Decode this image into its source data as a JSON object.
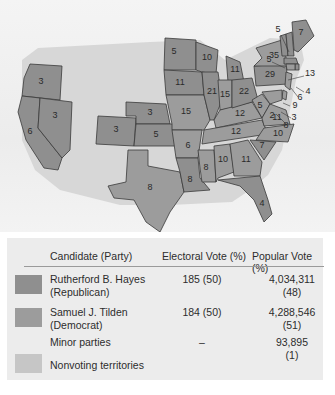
{
  "colors": {
    "republican": "#8f8f8f",
    "democrat": "#9c9c9c",
    "minor": "#cccccc",
    "nonvoting": "#c6c6c6",
    "land_unorg": "#d7d7d7"
  },
  "map": {
    "states": [
      {
        "id": "OR",
        "votes": "3",
        "party": "republican"
      },
      {
        "id": "CA",
        "votes": "6",
        "party": "republican"
      },
      {
        "id": "NV",
        "votes": "3",
        "party": "republican"
      },
      {
        "id": "CO",
        "votes": "3",
        "party": "republican"
      },
      {
        "id": "NE",
        "votes": "3",
        "party": "republican"
      },
      {
        "id": "KS",
        "votes": "5",
        "party": "republican"
      },
      {
        "id": "TX",
        "votes": "8",
        "party": "democrat"
      },
      {
        "id": "MN",
        "votes": "5",
        "party": "republican"
      },
      {
        "id": "IA",
        "votes": "11",
        "party": "republican"
      },
      {
        "id": "MO",
        "votes": "15",
        "party": "democrat"
      },
      {
        "id": "AR",
        "votes": "6",
        "party": "democrat"
      },
      {
        "id": "LA",
        "votes": "8",
        "party": "republican"
      },
      {
        "id": "WI",
        "votes": "10",
        "party": "republican"
      },
      {
        "id": "IL",
        "votes": "21",
        "party": "republican"
      },
      {
        "id": "MS",
        "votes": "8",
        "party": "democrat"
      },
      {
        "id": "MI",
        "votes": "11",
        "party": "republican"
      },
      {
        "id": "IN",
        "votes": "15",
        "party": "democrat"
      },
      {
        "id": "KY",
        "votes": "12",
        "party": "democrat"
      },
      {
        "id": "TN",
        "votes": "12",
        "party": "democrat"
      },
      {
        "id": "AL",
        "votes": "10",
        "party": "democrat"
      },
      {
        "id": "GA",
        "votes": "11",
        "party": "democrat"
      },
      {
        "id": "FL",
        "votes": "4",
        "party": "republican"
      },
      {
        "id": "OH",
        "votes": "22",
        "party": "republican"
      },
      {
        "id": "WV",
        "votes": "5",
        "party": "democrat"
      },
      {
        "id": "VA",
        "votes": "11",
        "party": "democrat"
      },
      {
        "id": "NC",
        "votes": "10",
        "party": "democrat"
      },
      {
        "id": "SC",
        "votes": "7",
        "party": "republican"
      },
      {
        "id": "PA",
        "votes": "29",
        "party": "republican"
      },
      {
        "id": "NY",
        "votes": "35",
        "party": "democrat"
      },
      {
        "id": "VT",
        "votes": "5",
        "party": "republican"
      },
      {
        "id": "NH",
        "votes": "5",
        "party": "republican"
      },
      {
        "id": "ME",
        "votes": "7",
        "party": "republican"
      },
      {
        "id": "MA",
        "votes": "13",
        "party": "republican"
      },
      {
        "id": "RI",
        "votes": "4",
        "party": "republican"
      },
      {
        "id": "CT",
        "votes": "6",
        "party": "democrat"
      },
      {
        "id": "NJ",
        "votes": "9",
        "party": "democrat"
      },
      {
        "id": "DE",
        "votes": "3",
        "party": "democrat"
      },
      {
        "id": "MD",
        "votes": "8",
        "party": "democrat"
      },
      {
        "id": "DC_MD_small",
        "votes": "2",
        "party": "democrat"
      }
    ]
  },
  "legend": {
    "headers": {
      "candidate": "Candidate (Party)",
      "electoral": "Electoral Vote (%)",
      "popular": "Popular Vote (%)"
    },
    "rows": [
      {
        "name": "Rutherford B. Hayes",
        "party": "(Republican)",
        "electoral": "185 (50)",
        "popular": "4,034,311",
        "popular_pct": "(48)",
        "swatch": "republican"
      },
      {
        "name": "Samuel J. Tilden",
        "party": "(Democrat)",
        "electoral": "184 (50)",
        "popular": "4,288,546",
        "popular_pct": "(51)",
        "swatch": "democrat"
      },
      {
        "name": "Minor parties",
        "party": "",
        "electoral": "–",
        "popular": "93,895",
        "popular_pct": "(1)",
        "swatch": ""
      },
      {
        "name": "Nonvoting territories",
        "party": "",
        "electoral": "",
        "popular": "",
        "popular_pct": "",
        "swatch": "nonvoting"
      }
    ]
  }
}
